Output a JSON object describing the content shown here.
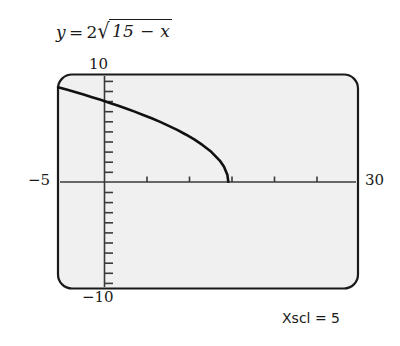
{
  "figure": {
    "equation": {
      "lhs": "y",
      "equals": "=",
      "coefficient": "2",
      "radical_sign": "√",
      "radicand": "15 − x",
      "plain": "y = 2√(15 − x)"
    },
    "axis_labels": {
      "y_top": "10",
      "y_bottom": "−10",
      "x_left": "−5",
      "x_right": "30"
    },
    "footnote": "Xscl = 5",
    "colors": {
      "screen_fill": "#f0f0f0",
      "screen_border": "#1a1a1a",
      "axis": "#3a3a3a",
      "curve": "#111111",
      "text": "#1a1a1a"
    }
  },
  "chart_data": {
    "type": "line",
    "xlabel": "",
    "ylabel": "",
    "xlim": [
      -5,
      30
    ],
    "ylim": [
      -10,
      10
    ],
    "xscl": 5,
    "yscl": 1,
    "grid": false,
    "legend": null,
    "annotations": [
      "Xscl = 5"
    ],
    "xticks": [
      0,
      5,
      10,
      15,
      20,
      25
    ],
    "yticks": [
      -9,
      -8,
      -7,
      -6,
      -5,
      -4,
      -3,
      -2,
      -1,
      1,
      2,
      3,
      4,
      5,
      6,
      7,
      8,
      9
    ],
    "series": [
      {
        "name": "y = 2 sqrt(15 - x)",
        "domain": [
          -5,
          15
        ],
        "x": [
          -5,
          -4,
          -3,
          -2,
          -1,
          0,
          1,
          2,
          3,
          4,
          5,
          6,
          7,
          8,
          9,
          10,
          11,
          12,
          13,
          14,
          14.5,
          14.9,
          15
        ],
        "y": [
          8.94,
          8.72,
          8.49,
          8.25,
          8.0,
          7.75,
          7.48,
          7.21,
          6.93,
          6.63,
          6.32,
          6.0,
          5.66,
          5.29,
          4.9,
          4.47,
          4.0,
          3.46,
          2.83,
          2.0,
          1.41,
          0.63,
          0
        ]
      }
    ]
  }
}
